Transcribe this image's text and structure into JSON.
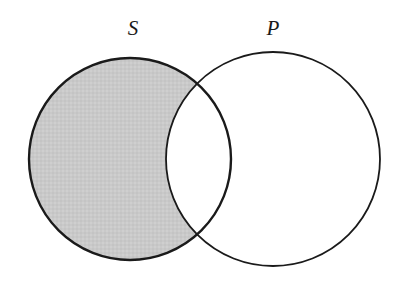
{
  "diagram": {
    "type": "venn-two-circle",
    "title": "",
    "background_color": "#ffffff",
    "stroke_color": "#1a1a1a",
    "shade_color": "#c9c9c9",
    "canvas": {
      "width": 402,
      "height": 281
    },
    "labels": {
      "subject": "S",
      "predicate": "P"
    },
    "label_positions": {
      "subject": {
        "x": 133,
        "y": 35
      },
      "predicate": {
        "x": 273,
        "y": 35
      }
    },
    "circles": [
      {
        "name": "S",
        "label": "S",
        "cx": 130,
        "cy": 159,
        "r": 101,
        "stroke_width": 2.4,
        "fill": "none"
      },
      {
        "name": "P",
        "label": "P",
        "cx": 273,
        "cy": 159,
        "r": 107,
        "stroke_width": 1.8,
        "fill": "none"
      }
    ],
    "regions": [
      {
        "name": "S-only",
        "description": "part of S outside P",
        "shaded": true,
        "fill": "#c9c9c9"
      },
      {
        "name": "S-and-P",
        "description": "intersection lens",
        "shaded": false,
        "fill": "#ffffff"
      },
      {
        "name": "P-only",
        "description": "part of P outside S",
        "shaded": false,
        "fill": "#ffffff"
      }
    ],
    "intersection_points": [
      {
        "x": 207,
        "y": 79
      },
      {
        "x": 207,
        "y": 248
      }
    ]
  }
}
